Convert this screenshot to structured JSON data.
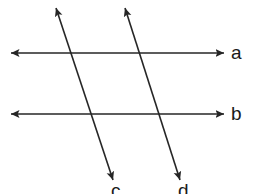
{
  "figure": {
    "background_color": "#ffffff",
    "stroke_color": "#262626",
    "label_color": "#1a1a1a",
    "width": 259,
    "height": 194
  },
  "labels": {
    "a": "a",
    "b": "b",
    "c": "c",
    "d": "d"
  },
  "chart_data": {
    "type": "diagram",
    "xlabel": "",
    "ylabel": "",
    "xlim": [
      0,
      259
    ],
    "ylim": [
      0,
      194
    ],
    "grid": false,
    "legend": "none",
    "lines": [
      {
        "name": "a",
        "label": "a",
        "orientation": "horizontal",
        "double_arrow": true,
        "x1": 11,
        "y1": 53,
        "x2": 224,
        "y2": 53,
        "label_x": 237,
        "label_y": 53
      },
      {
        "name": "b",
        "label": "b",
        "orientation": "horizontal",
        "double_arrow": true,
        "x1": 11,
        "y1": 114,
        "x2": 224,
        "y2": 114,
        "label_x": 237,
        "label_y": 114
      },
      {
        "name": "c",
        "label": "c",
        "orientation": "transversal",
        "double_arrow": true,
        "x1": 56,
        "y1": 8,
        "x2": 113,
        "y2": 180,
        "label_x": 117,
        "label_y": 190
      },
      {
        "name": "d",
        "label": "d",
        "orientation": "transversal",
        "double_arrow": true,
        "x1": 125,
        "y1": 8,
        "x2": 180,
        "y2": 180,
        "label_x": 184,
        "label_y": 190
      }
    ],
    "intersections": [
      {
        "lines": [
          "a",
          "c"
        ],
        "x": 74,
        "y": 53
      },
      {
        "lines": [
          "a",
          "d"
        ],
        "x": 142,
        "y": 53
      },
      {
        "lines": [
          "b",
          "c"
        ],
        "x": 94,
        "y": 114
      },
      {
        "lines": [
          "b",
          "d"
        ],
        "x": 163,
        "y": 114
      }
    ]
  }
}
